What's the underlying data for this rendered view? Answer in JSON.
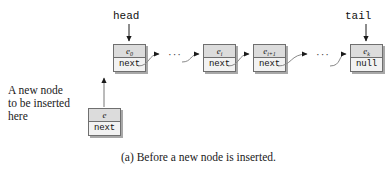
{
  "figure": {
    "caption": "(a) Before a new node is inserted.",
    "description_lines": [
      "A new node",
      "to be inserted",
      "here"
    ],
    "ellipsis": "···",
    "pointers": [
      {
        "name": "head",
        "label": "head"
      },
      {
        "name": "tail",
        "label": "tail"
      }
    ],
    "nodes": [
      {
        "id": "node-head",
        "value": "e",
        "subscript": "0",
        "next": "next"
      },
      {
        "id": "node-i",
        "value": "e",
        "subscript": "i",
        "next": "next"
      },
      {
        "id": "node-i-plus-1",
        "value": "e",
        "subscript": "i+1",
        "next": "next"
      },
      {
        "id": "node-tail",
        "value": "e",
        "subscript": "k",
        "next": "null"
      },
      {
        "id": "node-new",
        "value": "e",
        "subscript": "",
        "next": "next"
      }
    ],
    "colors": {
      "value_cell_fill": "#dcdcdc",
      "next_cell_fill": "#f2f2f2",
      "border": "#6f6f6f",
      "shadow": "#a8a8a8",
      "text": "#1a1a1a",
      "background": "#ffffff"
    }
  }
}
